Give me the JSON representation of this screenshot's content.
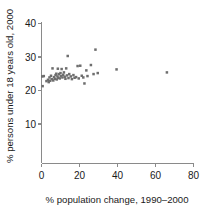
{
  "chart_data": {
    "type": "scatter",
    "title": "",
    "xlabel": "% population change, 1990–2000",
    "ylabel": "% persons under 18 years old, 2000",
    "xlim": [
      0,
      80
    ],
    "ylim": [
      0,
      40
    ],
    "xticks": [
      0,
      20,
      40,
      60,
      80
    ],
    "yticks": [
      10,
      20,
      30,
      40
    ],
    "xtick_labels": [
      "0",
      "20",
      "40",
      "60",
      "80"
    ],
    "ytick_labels": [
      "10",
      "20",
      "30",
      "40"
    ],
    "grid": false,
    "legend": null,
    "marker_color": "#6e6e6e",
    "axis_color": "#8a8a8a",
    "points": [
      {
        "x": 0.4,
        "y": 24.2
      },
      {
        "x": 0.6,
        "y": 21.3
      },
      {
        "x": 1.2,
        "y": 24.3
      },
      {
        "x": 2.6,
        "y": 22.8
      },
      {
        "x": 3.4,
        "y": 23.2
      },
      {
        "x": 3.8,
        "y": 22.5
      },
      {
        "x": 4.2,
        "y": 23.9
      },
      {
        "x": 4.6,
        "y": 22.9
      },
      {
        "x": 5.0,
        "y": 24.4
      },
      {
        "x": 5.4,
        "y": 23.4
      },
      {
        "x": 5.8,
        "y": 26.6
      },
      {
        "x": 6.2,
        "y": 23.0
      },
      {
        "x": 6.6,
        "y": 24.0
      },
      {
        "x": 7.0,
        "y": 23.5
      },
      {
        "x": 7.4,
        "y": 24.6
      },
      {
        "x": 7.8,
        "y": 25.0
      },
      {
        "x": 8.0,
        "y": 23.3
      },
      {
        "x": 8.4,
        "y": 24.2
      },
      {
        "x": 8.6,
        "y": 26.5
      },
      {
        "x": 8.8,
        "y": 23.8
      },
      {
        "x": 9.2,
        "y": 24.9
      },
      {
        "x": 9.6,
        "y": 23.6
      },
      {
        "x": 10.0,
        "y": 25.2
      },
      {
        "x": 10.2,
        "y": 24.3
      },
      {
        "x": 10.6,
        "y": 26.4
      },
      {
        "x": 11.0,
        "y": 23.9
      },
      {
        "x": 11.4,
        "y": 24.7
      },
      {
        "x": 11.8,
        "y": 25.4
      },
      {
        "x": 12.2,
        "y": 24.1
      },
      {
        "x": 12.6,
        "y": 23.5
      },
      {
        "x": 13.0,
        "y": 26.6
      },
      {
        "x": 13.4,
        "y": 24.5
      },
      {
        "x": 13.8,
        "y": 30.3
      },
      {
        "x": 14.2,
        "y": 23.7
      },
      {
        "x": 14.6,
        "y": 24.9
      },
      {
        "x": 15.4,
        "y": 24.2
      },
      {
        "x": 16.0,
        "y": 23.4
      },
      {
        "x": 16.8,
        "y": 24.6
      },
      {
        "x": 17.4,
        "y": 23.8
      },
      {
        "x": 18.2,
        "y": 24.0
      },
      {
        "x": 19.0,
        "y": 27.3
      },
      {
        "x": 19.6,
        "y": 23.6
      },
      {
        "x": 20.4,
        "y": 27.4
      },
      {
        "x": 21.2,
        "y": 24.4
      },
      {
        "x": 22.0,
        "y": 23.9
      },
      {
        "x": 22.6,
        "y": 22.1
      },
      {
        "x": 23.6,
        "y": 26.0
      },
      {
        "x": 24.2,
        "y": 24.3
      },
      {
        "x": 26.0,
        "y": 27.6
      },
      {
        "x": 27.4,
        "y": 24.9
      },
      {
        "x": 28.4,
        "y": 32.2
      },
      {
        "x": 29.6,
        "y": 25.2
      },
      {
        "x": 39.5,
        "y": 26.3
      },
      {
        "x": 66.0,
        "y": 25.4
      }
    ]
  }
}
